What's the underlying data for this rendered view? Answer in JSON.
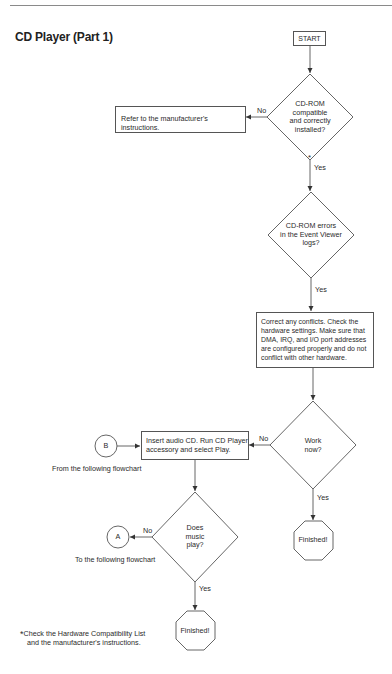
{
  "page": {
    "title": "CD Player (Part 1)"
  },
  "flowchart": {
    "start": "START",
    "decision_compatible": {
      "lines": [
        "CD-ROM",
        "compatible",
        "and correctly",
        "installed?"
      ],
      "no_label": "No",
      "yes_label": "Yes",
      "footnote_marker": "*"
    },
    "refer_box": "Refer to the manufacturer's instructions.",
    "decision_errors": {
      "lines": [
        "CD-ROM errors",
        "in the Event Viewer",
        "logs?"
      ],
      "yes_label": "Yes"
    },
    "correct_box": {
      "lines": [
        "Correct any conflicts. Check the",
        "hardware settings. Make sure that",
        "DMA, IRQ, and I/O port addresses",
        "are configured properly and do not",
        "conflict with other hardware."
      ]
    },
    "decision_work": {
      "lines": [
        "Work",
        "now?"
      ],
      "no_label": "No",
      "yes_label": "Yes"
    },
    "finished_1": "Finished!",
    "insert_box": {
      "lines": [
        "Insert audio CD. Run CD Player",
        "accessory and select Play."
      ]
    },
    "connector_b": {
      "label": "B",
      "caption": "From the following flowchart"
    },
    "decision_music": {
      "lines": [
        "Does",
        "music",
        "play?"
      ],
      "no_label": "No",
      "yes_label": "Yes"
    },
    "connector_a": {
      "label": "A",
      "caption": "To the following flowchart"
    },
    "finished_2": "Finished!",
    "footnote": {
      "marker": "*",
      "lines": [
        "Check the Hardware Compatibility List",
        "and the manufacturer's instructions."
      ]
    }
  },
  "colors": {
    "line": "#555555",
    "text": "#2a2a2a",
    "background": "#ffffff"
  }
}
